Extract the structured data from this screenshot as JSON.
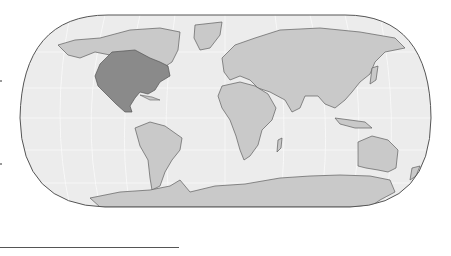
{
  "map": {
    "title": "",
    "projection": "pseudo-cylindrical world map (rounded frame)",
    "colors": {
      "ocean": "#ececec",
      "land": "#c9c9c9",
      "highlight": "#8a8a8a",
      "coast": "#5e5e5e",
      "graticule": "#f8f8f8",
      "frame": "#555555"
    },
    "highlighted_regions": [
      "United States",
      "Mexico"
    ],
    "continents": [
      "North America",
      "South America",
      "Europe",
      "Africa",
      "Asia",
      "Australia",
      "Antarctica",
      "Greenland"
    ]
  },
  "decorations": {
    "bottom_rule": true,
    "left_ticks": 2
  }
}
